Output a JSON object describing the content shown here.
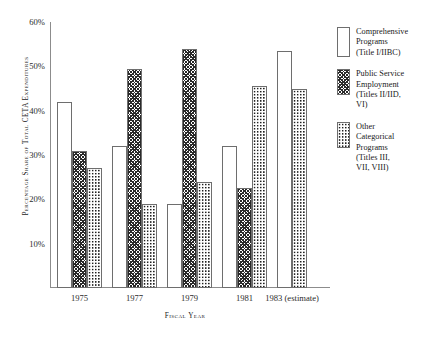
{
  "chart_data": {
    "type": "bar",
    "title": "",
    "xlabel": "Fiscal Year",
    "ylabel": "Percentage Share of Total CETA Expenditures",
    "categories": [
      "1975",
      "1977",
      "1979",
      "1981",
      "1983 (estimate)"
    ],
    "ylim": [
      0,
      60
    ],
    "ytick_labels": [
      "10%",
      "20%",
      "30%",
      "40%",
      "50%",
      "60%"
    ],
    "ytick_values": [
      10,
      20,
      30,
      40,
      50,
      60
    ],
    "y_unit": "%",
    "grid": false,
    "legend_position": "right",
    "series": [
      {
        "name": "Comprehensive Programs (Title I/IIBC)",
        "pattern": "open-white",
        "values": [
          42,
          32,
          19,
          32,
          53.5
        ]
      },
      {
        "name": "Public Service Employment (Titles II/IID, VI)",
        "pattern": "dense-cross-hatch",
        "values": [
          31,
          49.5,
          54,
          22.5,
          null
        ]
      },
      {
        "name": "Other Categorical Programs (Titles III, VII, VIII)",
        "pattern": "dotted-checker",
        "values": [
          27,
          19,
          24,
          45.5,
          45
        ]
      }
    ]
  },
  "legend": {
    "items": [
      {
        "label": "Comprehensive\nPrograms\n(Title I/IIBC)",
        "swatch": "open-white-swatch"
      },
      {
        "label": "Public Service\nEmployment\n(Titles II/IID,\nVI)",
        "swatch": "cross-hatch-swatch"
      },
      {
        "label": "Other\nCategorical\nPrograms\n(Titles III,\nVII, VIII)",
        "swatch": "dotted-swatch"
      }
    ]
  },
  "axes": {
    "y_title": "Percentage Share of Total CETA Expenditures",
    "x_title": "Fiscal Year"
  },
  "colors": {
    "axis": "#8c8c8c",
    "bar_outline": "#6e6e6e",
    "pattern_ink": "#1f1f1f",
    "text": "#1a1a1a",
    "background": "#ffffff"
  }
}
